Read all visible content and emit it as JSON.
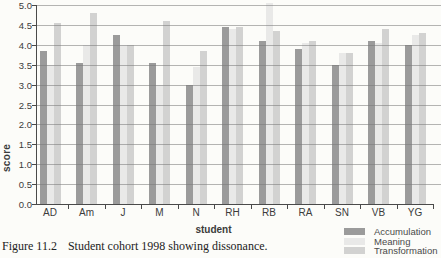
{
  "chart_data": {
    "type": "bar",
    "title": "",
    "xlabel": "student",
    "ylabel": "score",
    "categories": [
      "AD",
      "Am",
      "J",
      "M",
      "N",
      "RH",
      "RB",
      "RA",
      "SN",
      "VB",
      "YG"
    ],
    "series": [
      {
        "name": "Accumulation",
        "color": "#9b9b9b",
        "values": [
          3.85,
          3.55,
          4.25,
          3.55,
          3.0,
          4.45,
          4.1,
          3.9,
          3.5,
          4.1,
          4.0
        ]
      },
      {
        "name": "Meaning",
        "color": "#e9e9e8",
        "values": [
          3.5,
          4.0,
          4.0,
          3.0,
          3.45,
          4.4,
          5.05,
          4.05,
          3.8,
          4.05,
          4.25
        ]
      },
      {
        "name": "Transformation",
        "color": "#d2d2d1",
        "values": [
          4.55,
          4.8,
          4.0,
          4.6,
          3.85,
          4.45,
          4.35,
          4.1,
          3.8,
          4.4,
          4.3
        ]
      }
    ],
    "ylim": [
      0,
      5.0
    ],
    "ytick_step": 0.5,
    "yticks": [
      "0.0",
      "0.5",
      "1.0",
      "1.5",
      "2.0",
      "2.5",
      "3.0",
      "3.5",
      "4.0",
      "4.5",
      "5.0"
    ],
    "grid": true,
    "legend_position": "bottom-right",
    "colors": {
      "gridline": "#a8a8a8",
      "axis": "#4a4a4a",
      "background": "#fcfcf9",
      "text": "#3b3b3b"
    }
  },
  "caption": {
    "figure_label": "Figure 11.2",
    "text": "Student cohort 1998 showing dissonance."
  }
}
